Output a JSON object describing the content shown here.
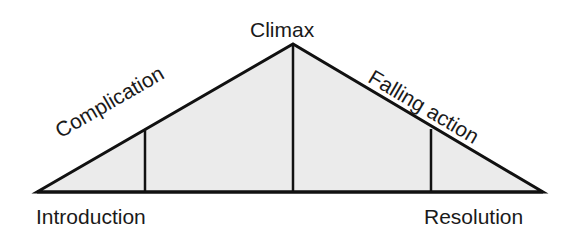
{
  "diagram": {
    "labels": {
      "introduction": "Introduction",
      "complication": "Complication",
      "climax": "Climax",
      "falling_action": "Falling action",
      "resolution": "Resolution"
    },
    "colors": {
      "fill": "#ebebeb",
      "stroke": "#111111",
      "text": "#1a1a1a"
    }
  }
}
